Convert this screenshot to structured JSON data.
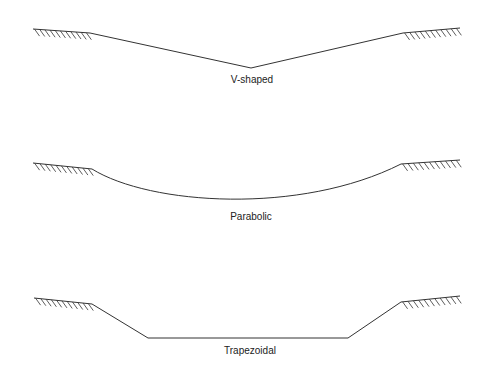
{
  "diagram": {
    "line_color": "#333333",
    "shapes": [
      {
        "id": "v-shaped",
        "label": "V-shaped",
        "label_pos": [
          252,
          74
        ],
        "bank_left": [
          [
            33,
            29
          ],
          [
            90,
            33
          ]
        ],
        "bank_right": [
          [
            403,
            33
          ],
          [
            460,
            28
          ]
        ],
        "profile": "M90,33 L251,68 L403,33"
      },
      {
        "id": "parabolic",
        "label": "Parabolic",
        "label_pos": [
          251,
          211
        ],
        "bank_left": [
          [
            33,
            163
          ],
          [
            92,
            169
          ]
        ],
        "bank_right": [
          [
            401,
            164
          ],
          [
            460,
            160
          ]
        ],
        "profile": "M92,169 C150,205 300,215 401,164"
      },
      {
        "id": "trapezoidal",
        "label": "Trapezoidal",
        "label_pos": [
          250,
          345
        ],
        "bank_left": [
          [
            34,
            298
          ],
          [
            92,
            304
          ]
        ],
        "bank_right": [
          [
            401,
            302
          ],
          [
            460,
            296
          ]
        ],
        "profile": "M92,304 L148,338 L348,338 L401,302"
      }
    ]
  }
}
